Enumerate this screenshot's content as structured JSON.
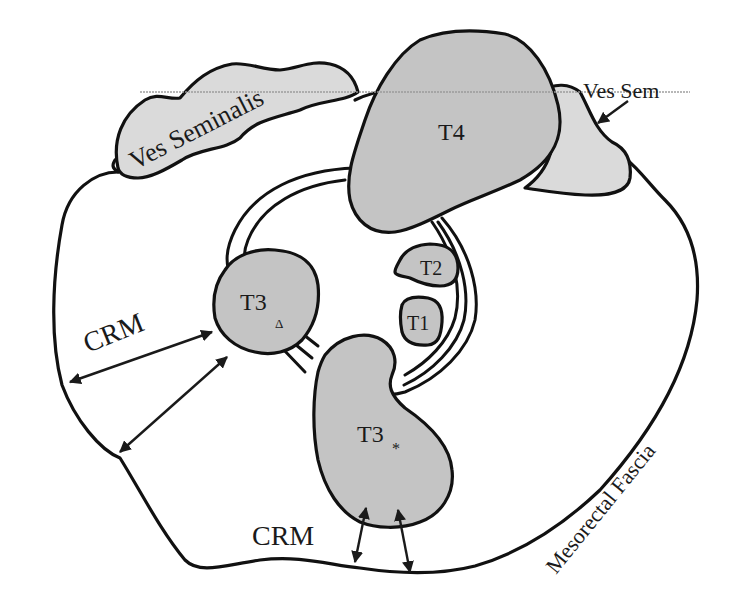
{
  "figure": {
    "type": "schematic cross-section",
    "labels": {
      "ves_seminalis": "Ves Seminalis",
      "ves_sem": "Ves Sem",
      "t4": "T4",
      "t2": "T2",
      "t1": "T1",
      "t3_triangle": "T3",
      "t3_triangle_sub": "Δ",
      "t3_star": "T3",
      "t3_star_sub": "*",
      "crm_left": "CRM",
      "crm_bottom": "CRM",
      "mesorectal_fascia": "Mesorectal Fascia"
    },
    "colors": {
      "tumor_fill": "#c4c4c4",
      "vesicle_fill": "#dadada",
      "stroke": "#111111",
      "background": "#ffffff"
    }
  }
}
